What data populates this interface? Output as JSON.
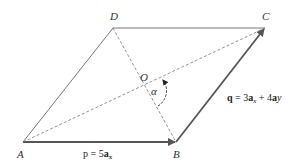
{
  "diagram": {
    "points": {
      "A": {
        "label": "A"
      },
      "B": {
        "label": "B"
      },
      "C": {
        "label": "C"
      },
      "D": {
        "label": "D"
      },
      "O": {
        "label": "O"
      }
    },
    "angle_label": "α",
    "vector_p": {
      "name": "p",
      "eq": " = 5",
      "unit": "a",
      "sub": "x"
    },
    "vector_q": {
      "name": "q",
      "eq": " = 3",
      "unit1": "a",
      "sub1": "x",
      "plus": " + 4",
      "unit2": "a",
      "sub2": "y"
    },
    "colors": {
      "solid": "#666666",
      "dashed": "#777777",
      "arrow": "#555555"
    }
  }
}
